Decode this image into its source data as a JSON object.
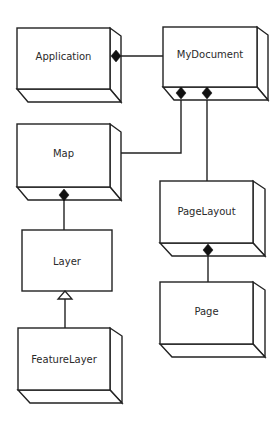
{
  "diagram": {
    "type": "UML class diagram",
    "classes": [
      {
        "id": "application",
        "label": "Application"
      },
      {
        "id": "mydocument",
        "label": "MyDocument"
      },
      {
        "id": "map",
        "label": "Map"
      },
      {
        "id": "layer",
        "label": "Layer"
      },
      {
        "id": "featurelayer",
        "label": "FeatureLayer"
      },
      {
        "id": "pagelayout",
        "label": "PageLayout"
      },
      {
        "id": "page",
        "label": "Page"
      }
    ],
    "relationships": [
      {
        "from": "application",
        "to": "mydocument",
        "type": "composition",
        "diamond_at": "application"
      },
      {
        "from": "mydocument",
        "to": "map",
        "type": "composition",
        "diamond_at": "mydocument"
      },
      {
        "from": "mydocument",
        "to": "pagelayout",
        "type": "composition",
        "diamond_at": "mydocument"
      },
      {
        "from": "map",
        "to": "layer",
        "type": "composition",
        "diamond_at": "map"
      },
      {
        "from": "featurelayer",
        "to": "layer",
        "type": "inheritance",
        "arrow_at": "layer"
      },
      {
        "from": "pagelayout",
        "to": "page",
        "type": "composition",
        "diamond_at": "pagelayout"
      }
    ]
  }
}
